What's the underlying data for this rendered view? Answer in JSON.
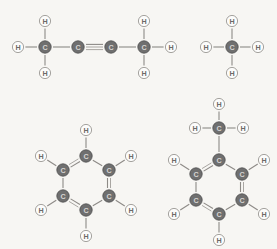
{
  "figure": {
    "background_color": "#f7f6f3",
    "carbon_fill": "#6f6f6f",
    "carbon_label_color": "#d8d6d3",
    "hydrogen_fill": "#fcfcfb",
    "hydrogen_label_color": "#6d6a67",
    "bond_color": "#8d8a86",
    "carbon_symbol": "C",
    "hydrogen_symbol": "H"
  },
  "molecules": [
    {
      "id": "butyne",
      "name": "2-butyne",
      "formula": "CH3-C#C-CH3",
      "atoms": [
        {
          "id": "c1",
          "element": "C",
          "label": "C",
          "x": 45,
          "y": 47
        },
        {
          "id": "c2",
          "element": "C",
          "label": "C",
          "x": 78,
          "y": 47
        },
        {
          "id": "c3",
          "element": "C",
          "label": "C",
          "x": 111,
          "y": 47
        },
        {
          "id": "c4",
          "element": "C",
          "label": "C",
          "x": 144,
          "y": 47
        },
        {
          "id": "h1",
          "element": "H",
          "label": "H",
          "x": 18,
          "y": 47
        },
        {
          "id": "h2",
          "element": "H",
          "label": "H",
          "x": 45,
          "y": 21
        },
        {
          "id": "h3",
          "element": "H",
          "label": "H",
          "x": 45,
          "y": 73
        },
        {
          "id": "h4",
          "element": "H",
          "label": "H",
          "x": 144,
          "y": 21
        },
        {
          "id": "h5",
          "element": "H",
          "label": "H",
          "x": 144,
          "y": 73
        },
        {
          "id": "h6",
          "element": "H",
          "label": "H",
          "x": 171,
          "y": 47
        }
      ],
      "bonds": [
        {
          "from": "h1",
          "to": "c1",
          "order": 1
        },
        {
          "from": "h2",
          "to": "c1",
          "order": 1
        },
        {
          "from": "h3",
          "to": "c1",
          "order": 1
        },
        {
          "from": "c1",
          "to": "c2",
          "order": 1
        },
        {
          "from": "c2",
          "to": "c3",
          "order": 3
        },
        {
          "from": "c3",
          "to": "c4",
          "order": 1
        },
        {
          "from": "c4",
          "to": "h4",
          "order": 1
        },
        {
          "from": "c4",
          "to": "h5",
          "order": 1
        },
        {
          "from": "c4",
          "to": "h6",
          "order": 1
        }
      ]
    },
    {
      "id": "methane",
      "name": "methane",
      "formula": "CH4",
      "atoms": [
        {
          "id": "c1",
          "element": "C",
          "label": "C",
          "x": 232,
          "y": 47
        },
        {
          "id": "h1",
          "element": "H",
          "label": "H",
          "x": 232,
          "y": 21
        },
        {
          "id": "h2",
          "element": "H",
          "label": "H",
          "x": 206,
          "y": 47
        },
        {
          "id": "h3",
          "element": "H",
          "label": "H",
          "x": 258,
          "y": 47
        },
        {
          "id": "h4",
          "element": "H",
          "label": "H",
          "x": 232,
          "y": 73
        }
      ],
      "bonds": [
        {
          "from": "c1",
          "to": "h1",
          "order": 1
        },
        {
          "from": "c1",
          "to": "h2",
          "order": 1
        },
        {
          "from": "c1",
          "to": "h3",
          "order": 1
        },
        {
          "from": "c1",
          "to": "h4",
          "order": 1
        }
      ]
    },
    {
      "id": "benzene",
      "name": "benzene",
      "formula": "C6H6",
      "atoms": [
        {
          "id": "c1",
          "element": "C",
          "label": "C",
          "x": 86,
          "y": 156
        },
        {
          "id": "c2",
          "element": "C",
          "label": "C",
          "x": 63,
          "y": 170
        },
        {
          "id": "c3",
          "element": "C",
          "label": "C",
          "x": 63,
          "y": 196
        },
        {
          "id": "c4",
          "element": "C",
          "label": "C",
          "x": 86,
          "y": 210
        },
        {
          "id": "c5",
          "element": "C",
          "label": "C",
          "x": 109,
          "y": 196
        },
        {
          "id": "c6",
          "element": "C",
          "label": "C",
          "x": 109,
          "y": 170
        },
        {
          "id": "h1",
          "element": "H",
          "label": "H",
          "x": 86,
          "y": 130
        },
        {
          "id": "h2",
          "element": "H",
          "label": "H",
          "x": 41,
          "y": 156
        },
        {
          "id": "h3",
          "element": "H",
          "label": "H",
          "x": 41,
          "y": 210
        },
        {
          "id": "h4",
          "element": "H",
          "label": "H",
          "x": 86,
          "y": 236
        },
        {
          "id": "h5",
          "element": "H",
          "label": "H",
          "x": 131,
          "y": 210
        },
        {
          "id": "h6",
          "element": "H",
          "label": "H",
          "x": 131,
          "y": 156
        }
      ],
      "bonds": [
        {
          "from": "c1",
          "to": "c2",
          "order": 2
        },
        {
          "from": "c2",
          "to": "c3",
          "order": 1
        },
        {
          "from": "c3",
          "to": "c4",
          "order": 2
        },
        {
          "from": "c4",
          "to": "c5",
          "order": 1
        },
        {
          "from": "c5",
          "to": "c6",
          "order": 2
        },
        {
          "from": "c6",
          "to": "c1",
          "order": 1
        },
        {
          "from": "c1",
          "to": "h1",
          "order": 1
        },
        {
          "from": "c2",
          "to": "h2",
          "order": 1
        },
        {
          "from": "c3",
          "to": "h3",
          "order": 1
        },
        {
          "from": "c4",
          "to": "h4",
          "order": 1
        },
        {
          "from": "c5",
          "to": "h5",
          "order": 1
        },
        {
          "from": "c6",
          "to": "h6",
          "order": 1
        }
      ]
    },
    {
      "id": "toluene",
      "name": "toluene",
      "formula": "C6H5-CH3",
      "atoms": [
        {
          "id": "c1",
          "element": "C",
          "label": "C",
          "x": 219,
          "y": 160
        },
        {
          "id": "c2",
          "element": "C",
          "label": "C",
          "x": 196,
          "y": 174
        },
        {
          "id": "c3",
          "element": "C",
          "label": "C",
          "x": 196,
          "y": 200
        },
        {
          "id": "c4",
          "element": "C",
          "label": "C",
          "x": 219,
          "y": 214
        },
        {
          "id": "c5",
          "element": "C",
          "label": "C",
          "x": 242,
          "y": 200
        },
        {
          "id": "c6",
          "element": "C",
          "label": "C",
          "x": 242,
          "y": 174
        },
        {
          "id": "c7",
          "element": "C",
          "label": "C",
          "x": 219,
          "y": 128
        },
        {
          "id": "h1",
          "element": "H",
          "label": "H",
          "x": 219,
          "y": 104
        },
        {
          "id": "h2",
          "element": "H",
          "label": "H",
          "x": 195,
          "y": 128
        },
        {
          "id": "h3",
          "element": "H",
          "label": "H",
          "x": 243,
          "y": 128
        },
        {
          "id": "h4",
          "element": "H",
          "label": "H",
          "x": 174,
          "y": 160
        },
        {
          "id": "h5",
          "element": "H",
          "label": "H",
          "x": 174,
          "y": 214
        },
        {
          "id": "h6",
          "element": "H",
          "label": "H",
          "x": 219,
          "y": 240
        },
        {
          "id": "h7",
          "element": "H",
          "label": "H",
          "x": 264,
          "y": 214
        },
        {
          "id": "h8",
          "element": "H",
          "label": "H",
          "x": 264,
          "y": 160
        }
      ],
      "bonds": [
        {
          "from": "c1",
          "to": "c2",
          "order": 2
        },
        {
          "from": "c2",
          "to": "c3",
          "order": 1
        },
        {
          "from": "c3",
          "to": "c4",
          "order": 2
        },
        {
          "from": "c4",
          "to": "c5",
          "order": 1
        },
        {
          "from": "c5",
          "to": "c6",
          "order": 2
        },
        {
          "from": "c6",
          "to": "c1",
          "order": 1
        },
        {
          "from": "c1",
          "to": "c7",
          "order": 1
        },
        {
          "from": "c7",
          "to": "h1",
          "order": 1
        },
        {
          "from": "c7",
          "to": "h2",
          "order": 1
        },
        {
          "from": "c7",
          "to": "h3",
          "order": 1
        },
        {
          "from": "c2",
          "to": "h4",
          "order": 1
        },
        {
          "from": "c3",
          "to": "h5",
          "order": 1
        },
        {
          "from": "c4",
          "to": "h6",
          "order": 1
        },
        {
          "from": "c5",
          "to": "h7",
          "order": 1
        },
        {
          "from": "c6",
          "to": "h8",
          "order": 1
        }
      ]
    }
  ]
}
